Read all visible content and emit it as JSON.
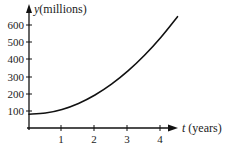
{
  "chart_data": {
    "type": "line",
    "title": "",
    "xlabel": "t (years)",
    "ylabel": "y (millions)",
    "xlabel_var": "t",
    "xlabel_unit": "(years)",
    "ylabel_var": "y",
    "ylabel_unit": "(millions)",
    "x_ticks": [
      1,
      2,
      3,
      4
    ],
    "y_ticks": [
      100,
      200,
      300,
      400,
      500,
      600
    ],
    "xlim": [
      0,
      4.5
    ],
    "ylim": [
      0,
      650
    ],
    "grid": false,
    "legend": null,
    "series": [
      {
        "name": "y(t)",
        "x": [
          0,
          0.5,
          1,
          1.5,
          2,
          2.5,
          3,
          3.5,
          4,
          4.5
        ],
        "values": [
          80,
          87,
          108,
          143,
          192,
          255,
          332,
          423,
          528,
          647
        ]
      }
    ]
  },
  "labels": {
    "x_var": "t",
    "x_unit": "(years)",
    "y_var": "y",
    "y_unit": "(millions)",
    "x_ticks": [
      "1",
      "2",
      "3",
      "4"
    ],
    "y_ticks": [
      "100",
      "200",
      "300",
      "400",
      "500",
      "600"
    ]
  }
}
